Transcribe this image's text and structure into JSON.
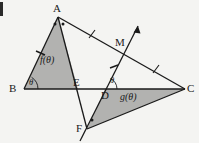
{
  "figure": {
    "type": "geometry-diagram",
    "background_color": "#f4f4f2",
    "stroke_color": "#1a1a1a",
    "shade_color": "#b0b0b0",
    "vertices": [
      {
        "id": "A",
        "label": "A",
        "x": 58,
        "y": 17,
        "label_x": 53,
        "label_y": 4
      },
      {
        "id": "B",
        "label": "B",
        "x": 24,
        "y": 89,
        "label_x": 10,
        "label_y": 84
      },
      {
        "id": "C",
        "label": "C",
        "x": 185,
        "y": 89,
        "label_x": 188,
        "label_y": 84
      },
      {
        "id": "E",
        "label": "E",
        "x": 78,
        "y": 89,
        "label_x": 74,
        "label_y": 78
      },
      {
        "id": "D",
        "label": "D",
        "x": 105,
        "y": 89,
        "label_x": 102,
        "label_y": 91
      },
      {
        "id": "F",
        "label": "F",
        "x": 87,
        "y": 129,
        "label_x": 77,
        "label_y": 124
      },
      {
        "id": "M",
        "label": "M",
        "x": 126,
        "y": 47,
        "label_x": 116,
        "label_y": 38
      }
    ],
    "region_labels": [
      {
        "id": "f-region",
        "label": "f(θ)",
        "x": 44,
        "y": 60
      },
      {
        "id": "g-region",
        "label": "g(θ)",
        "x": 124,
        "y": 96
      }
    ],
    "angle_labels": [
      {
        "id": "angle-at-B",
        "label": "θ",
        "x": 30,
        "y": 80
      },
      {
        "id": "angle-at-D",
        "label": "θ",
        "x": 110,
        "y": 78
      }
    ],
    "shaded_regions": [
      {
        "id": "triangle-ABE",
        "points": "58,17 24,89 78,89"
      },
      {
        "id": "triangle-DFC",
        "points": "105,89 87,129 185,89"
      }
    ],
    "segments": [
      {
        "id": "segment-AB",
        "x1": 58,
        "y1": 17,
        "x2": 24,
        "y2": 89
      },
      {
        "id": "segment-BC",
        "x1": 24,
        "y1": 89,
        "x2": 185,
        "y2": 89
      },
      {
        "id": "segment-AC",
        "x1": 58,
        "y1": 17,
        "x2": 185,
        "y2": 89
      },
      {
        "id": "segment-AF",
        "x1": 58,
        "y1": 17,
        "x2": 87,
        "y2": 129
      },
      {
        "id": "segment-FC",
        "x1": 87,
        "y1": 129,
        "x2": 185,
        "y2": 89
      },
      {
        "id": "line-FDM",
        "x1": 80,
        "y1": 141,
        "x2": 137,
        "y2": 28
      }
    ],
    "tick_marks": [
      {
        "id": "tick-AB",
        "x": 40,
        "y": 53
      },
      {
        "id": "tick-AM",
        "x": 92,
        "y": 34
      },
      {
        "id": "tick-MC",
        "x": 156,
        "y": 69
      },
      {
        "id": "tick-DM",
        "x": 114,
        "y": 67
      }
    ],
    "vertex_dots": [
      {
        "id": "dot-A-left",
        "x": 55,
        "y": 24
      },
      {
        "id": "dot-A-right",
        "x": 62,
        "y": 24
      },
      {
        "id": "dot-F",
        "x": 91,
        "y": 121
      }
    ],
    "arrow": {
      "id": "arrow-FDM",
      "x": 137,
      "y": 28
    }
  }
}
